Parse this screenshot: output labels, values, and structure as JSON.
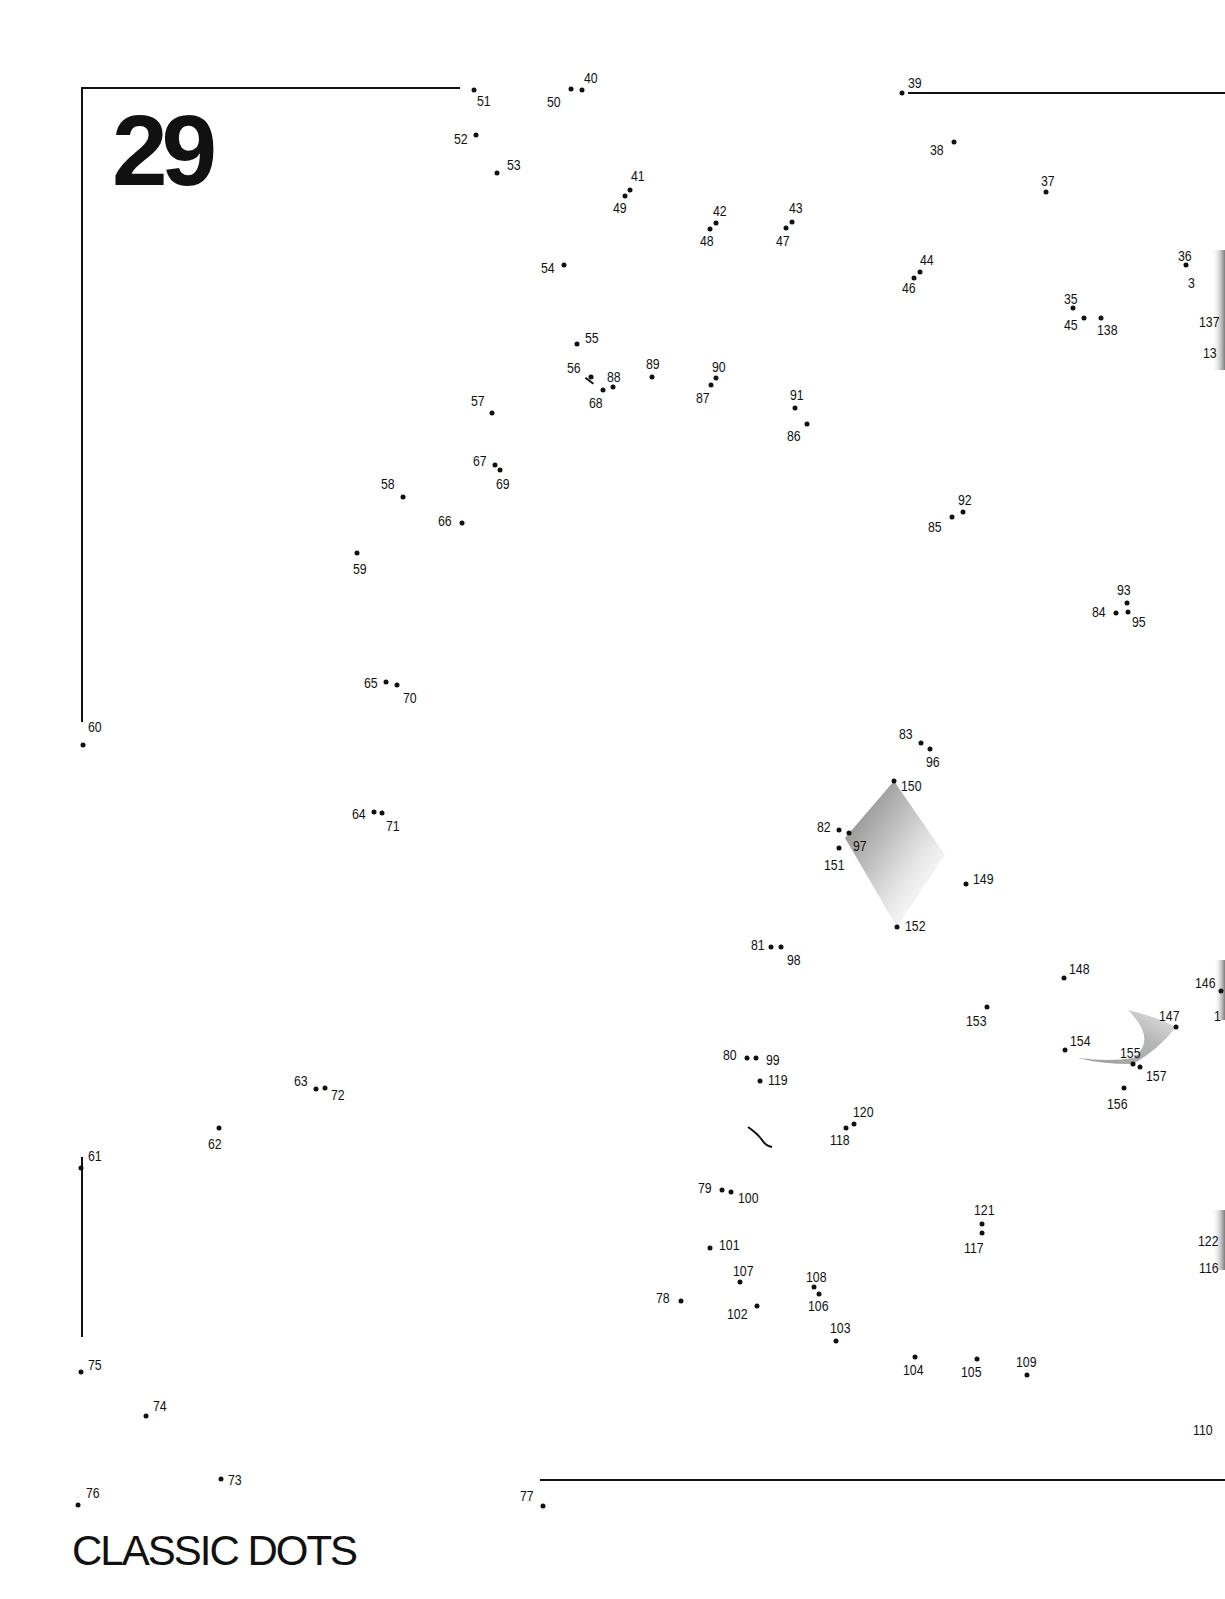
{
  "page": {
    "puzzle_number": "29",
    "title": "CLASSIC DOTS"
  },
  "lines": [
    {
      "name": "top-left-line",
      "x1": 83,
      "y1": 87,
      "x2": 460,
      "y2": 87
    },
    {
      "name": "left-upper-line",
      "x1": 83,
      "y1": 87,
      "x2": 83,
      "y2": 722
    },
    {
      "name": "top-right-line",
      "x1": 908,
      "y1": 92,
      "x2": 1225,
      "y2": 92
    },
    {
      "name": "left-lower-line",
      "x1": 83,
      "y1": 1157,
      "x2": 83,
      "y2": 1337
    },
    {
      "name": "bottom-line",
      "x1": 540,
      "y1": 1479,
      "x2": 1225,
      "y2": 1479
    },
    {
      "name": "stroke-56-68",
      "x1": 586,
      "y1": 377,
      "x2": 594,
      "y2": 383
    }
  ],
  "dots": [
    {
      "n": "35",
      "x": 1073,
      "y": 308,
      "lx": 1064,
      "ly": 291
    },
    {
      "n": "36",
      "x": 1186,
      "y": 265,
      "lx": 1178,
      "ly": 248
    },
    {
      "n": "3",
      "x": null,
      "y": null,
      "lx": 1188,
      "ly": 275
    },
    {
      "n": "37",
      "x": 1046,
      "y": 192,
      "lx": 1041,
      "ly": 173
    },
    {
      "n": "38",
      "x": 954,
      "y": 142,
      "lx": 930,
      "ly": 142
    },
    {
      "n": "39",
      "x": 902,
      "y": 93,
      "lx": 908,
      "ly": 75
    },
    {
      "n": "40",
      "x": 582,
      "y": 90,
      "lx": 584,
      "ly": 70
    },
    {
      "n": "41",
      "x": 630,
      "y": 190,
      "lx": 631,
      "ly": 168
    },
    {
      "n": "42",
      "x": 716,
      "y": 223,
      "lx": 713,
      "ly": 203
    },
    {
      "n": "43",
      "x": 792,
      "y": 222,
      "lx": 789,
      "ly": 200
    },
    {
      "n": "44",
      "x": 920,
      "y": 272,
      "lx": 920,
      "ly": 252
    },
    {
      "n": "45",
      "x": 1084,
      "y": 318,
      "lx": 1064,
      "ly": 317
    },
    {
      "n": "46",
      "x": 914,
      "y": 278,
      "lx": 902,
      "ly": 280
    },
    {
      "n": "47",
      "x": 786,
      "y": 228,
      "lx": 776,
      "ly": 233
    },
    {
      "n": "48",
      "x": 710,
      "y": 229,
      "lx": 700,
      "ly": 233
    },
    {
      "n": "49",
      "x": 625,
      "y": 196,
      "lx": 613,
      "ly": 200
    },
    {
      "n": "50",
      "x": 571,
      "y": 89,
      "lx": 547,
      "ly": 94
    },
    {
      "n": "51",
      "x": 474,
      "y": 90,
      "lx": 477,
      "ly": 93
    },
    {
      "n": "52",
      "x": 476,
      "y": 135,
      "lx": 454,
      "ly": 131
    },
    {
      "n": "53",
      "x": 497,
      "y": 173,
      "lx": 507,
      "ly": 157
    },
    {
      "n": "54",
      "x": 564,
      "y": 265,
      "lx": 541,
      "ly": 260
    },
    {
      "n": "55",
      "x": 577,
      "y": 344,
      "lx": 585,
      "ly": 330
    },
    {
      "n": "56",
      "x": 591,
      "y": 377,
      "lx": 567,
      "ly": 360
    },
    {
      "n": "57",
      "x": 492,
      "y": 413,
      "lx": 471,
      "ly": 393
    },
    {
      "n": "58",
      "x": 403,
      "y": 497,
      "lx": 381,
      "ly": 476
    },
    {
      "n": "59",
      "x": 357,
      "y": 553,
      "lx": 353,
      "ly": 561
    },
    {
      "n": "60",
      "x": 83,
      "y": 745,
      "lx": 88,
      "ly": 719
    },
    {
      "n": "61",
      "x": 81,
      "y": 1168,
      "lx": 88,
      "ly": 1148
    },
    {
      "n": "62",
      "x": 219,
      "y": 1128,
      "lx": 208,
      "ly": 1136
    },
    {
      "n": "63",
      "x": 316,
      "y": 1089,
      "lx": 294,
      "ly": 1073
    },
    {
      "n": "64",
      "x": 374,
      "y": 812,
      "lx": 352,
      "ly": 806
    },
    {
      "n": "65",
      "x": 386,
      "y": 682,
      "lx": 364,
      "ly": 675
    },
    {
      "n": "66",
      "x": 462,
      "y": 523,
      "lx": 438,
      "ly": 513
    },
    {
      "n": "67",
      "x": 495,
      "y": 465,
      "lx": 473,
      "ly": 453
    },
    {
      "n": "68",
      "x": 603,
      "y": 390,
      "lx": 589,
      "ly": 395
    },
    {
      "n": "69",
      "x": 500,
      "y": 470,
      "lx": 496,
      "ly": 476
    },
    {
      "n": "70",
      "x": 397,
      "y": 685,
      "lx": 403,
      "ly": 690
    },
    {
      "n": "71",
      "x": 382,
      "y": 813,
      "lx": 386,
      "ly": 818
    },
    {
      "n": "72",
      "x": 325,
      "y": 1088,
      "lx": 331,
      "ly": 1087
    },
    {
      "n": "73",
      "x": 221,
      "y": 1479,
      "lx": 228,
      "ly": 1472
    },
    {
      "n": "74",
      "x": 146,
      "y": 1416,
      "lx": 153,
      "ly": 1398
    },
    {
      "n": "75",
      "x": 81,
      "y": 1372,
      "lx": 88,
      "ly": 1357
    },
    {
      "n": "76",
      "x": 78,
      "y": 1505,
      "lx": 86,
      "ly": 1485
    },
    {
      "n": "77",
      "x": 543,
      "y": 1506,
      "lx": 520,
      "ly": 1488
    },
    {
      "n": "78",
      "x": 681,
      "y": 1301,
      "lx": 656,
      "ly": 1290
    },
    {
      "n": "79",
      "x": 722,
      "y": 1190,
      "lx": 698,
      "ly": 1180
    },
    {
      "n": "80",
      "x": 747,
      "y": 1058,
      "lx": 723,
      "ly": 1047
    },
    {
      "n": "81",
      "x": 771,
      "y": 947,
      "lx": 751,
      "ly": 937
    },
    {
      "n": "82",
      "x": 839,
      "y": 830,
      "lx": 817,
      "ly": 819
    },
    {
      "n": "83",
      "x": 921,
      "y": 743,
      "lx": 899,
      "ly": 726
    },
    {
      "n": "84",
      "x": 1116,
      "y": 613,
      "lx": 1092,
      "ly": 604
    },
    {
      "n": "85",
      "x": 952,
      "y": 517,
      "lx": 928,
      "ly": 519
    },
    {
      "n": "86",
      "x": 807,
      "y": 424,
      "lx": 787,
      "ly": 428
    },
    {
      "n": "87",
      "x": 711,
      "y": 385,
      "lx": 696,
      "ly": 390
    },
    {
      "n": "88",
      "x": 613,
      "y": 387,
      "lx": 607,
      "ly": 369
    },
    {
      "n": "89",
      "x": 652,
      "y": 377,
      "lx": 646,
      "ly": 356
    },
    {
      "n": "90",
      "x": 716,
      "y": 378,
      "lx": 712,
      "ly": 359
    },
    {
      "n": "91",
      "x": 795,
      "y": 408,
      "lx": 790,
      "ly": 387
    },
    {
      "n": "92",
      "x": 963,
      "y": 512,
      "lx": 958,
      "ly": 492
    },
    {
      "n": "93",
      "x": 1127,
      "y": 603,
      "lx": 1117,
      "ly": 582
    },
    {
      "n": "95",
      "x": 1128,
      "y": 612,
      "lx": 1132,
      "ly": 614
    },
    {
      "n": "96",
      "x": 930,
      "y": 749,
      "lx": 926,
      "ly": 754
    },
    {
      "n": "97",
      "x": 849,
      "y": 833,
      "lx": 853,
      "ly": 838
    },
    {
      "n": "98",
      "x": 781,
      "y": 947,
      "lx": 787,
      "ly": 952
    },
    {
      "n": "99",
      "x": 756,
      "y": 1058,
      "lx": 766,
      "ly": 1052
    },
    {
      "n": "100",
      "x": 731,
      "y": 1192,
      "lx": 738,
      "ly": 1190
    },
    {
      "n": "101",
      "x": 710,
      "y": 1248,
      "lx": 719,
      "ly": 1237
    },
    {
      "n": "102",
      "x": 757,
      "y": 1306,
      "lx": 727,
      "ly": 1306
    },
    {
      "n": "103",
      "x": 836,
      "y": 1341,
      "lx": 830,
      "ly": 1320
    },
    {
      "n": "104",
      "x": 915,
      "y": 1357,
      "lx": 903,
      "ly": 1362
    },
    {
      "n": "105",
      "x": 977,
      "y": 1359,
      "lx": 961,
      "ly": 1364
    },
    {
      "n": "106",
      "x": 819,
      "y": 1294,
      "lx": 808,
      "ly": 1298
    },
    {
      "n": "107",
      "x": 740,
      "y": 1282,
      "lx": 733,
      "ly": 1263
    },
    {
      "n": "108",
      "x": 814,
      "y": 1287,
      "lx": 806,
      "ly": 1269
    },
    {
      "n": "109",
      "x": 1027,
      "y": 1375,
      "lx": 1016,
      "ly": 1354
    },
    {
      "n": "110",
      "x": null,
      "y": null,
      "lx": 1193,
      "ly": 1422
    },
    {
      "n": "116",
      "x": null,
      "y": null,
      "lx": 1199,
      "ly": 1260
    },
    {
      "n": "117",
      "x": 982,
      "y": 1233,
      "lx": 964,
      "ly": 1240
    },
    {
      "n": "118",
      "x": 846,
      "y": 1128,
      "lx": 830,
      "ly": 1132
    },
    {
      "n": "119",
      "x": 760,
      "y": 1081,
      "lx": 768,
      "ly": 1072
    },
    {
      "n": "120",
      "x": 854,
      "y": 1124,
      "lx": 853,
      "ly": 1104
    },
    {
      "n": "121",
      "x": 982,
      "y": 1224,
      "lx": 974,
      "ly": 1202
    },
    {
      "n": "122",
      "x": null,
      "y": null,
      "lx": 1198,
      "ly": 1233
    },
    {
      "n": "13",
      "x": null,
      "y": null,
      "lx": 1203,
      "ly": 345
    },
    {
      "n": "137",
      "x": null,
      "y": null,
      "lx": 1199,
      "ly": 314
    },
    {
      "n": "138",
      "x": 1101,
      "y": 318,
      "lx": 1097,
      "ly": 322
    },
    {
      "n": "146",
      "x": 1221,
      "y": 991,
      "lx": 1195,
      "ly": 975
    },
    {
      "n": "1",
      "x": null,
      "y": null,
      "lx": 1214,
      "ly": 1008
    },
    {
      "n": "147",
      "x": 1176,
      "y": 1027,
      "lx": 1159,
      "ly": 1008
    },
    {
      "n": "148",
      "x": 1064,
      "y": 978,
      "lx": 1069,
      "ly": 961
    },
    {
      "n": "149",
      "x": 966,
      "y": 884,
      "lx": 973,
      "ly": 871
    },
    {
      "n": "150",
      "x": 894,
      "y": 781,
      "lx": 901,
      "ly": 778
    },
    {
      "n": "151",
      "x": 839,
      "y": 848,
      "lx": 824,
      "ly": 857
    },
    {
      "n": "152",
      "x": 897,
      "y": 927,
      "lx": 905,
      "ly": 918
    },
    {
      "n": "153",
      "x": 987,
      "y": 1007,
      "lx": 966,
      "ly": 1013
    },
    {
      "n": "154",
      "x": 1065,
      "y": 1050,
      "lx": 1070,
      "ly": 1033
    },
    {
      "n": "155",
      "x": 1133,
      "y": 1064,
      "lx": 1120,
      "ly": 1045
    },
    {
      "n": "156",
      "x": 1124,
      "y": 1088,
      "lx": 1107,
      "ly": 1096
    },
    {
      "n": "157",
      "x": 1140,
      "y": 1067,
      "lx": 1146,
      "ly": 1068
    }
  ],
  "colors": {
    "ink": "#111111",
    "paper": "#ffffff",
    "shading": "#8c8c8c"
  }
}
